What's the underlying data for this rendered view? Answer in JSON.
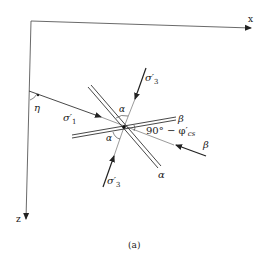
{
  "figure": {
    "caption": "(a)",
    "axes": {
      "x_label": "x",
      "z_label": "z"
    },
    "angles": {
      "eta": "η",
      "alpha_upper": "α",
      "alpha_lower": "α",
      "critical": "90° − φ′cs",
      "critical_main": "90° − φ′",
      "critical_sub": "cs"
    },
    "stresses": {
      "sigma1": "σ′1",
      "sigma1_main": "σ′",
      "sigma1_sub": "1",
      "sigma3_upper_main": "σ′",
      "sigma3_upper_sub": "3",
      "sigma3_lower_main": "σ′",
      "sigma3_lower_sub": "3"
    },
    "planes": {
      "alpha_plane_label": "α",
      "beta_plane_label": "β",
      "beta_force_label": "β"
    },
    "colors": {
      "line": "#333333",
      "background": "#ffffff"
    }
  }
}
